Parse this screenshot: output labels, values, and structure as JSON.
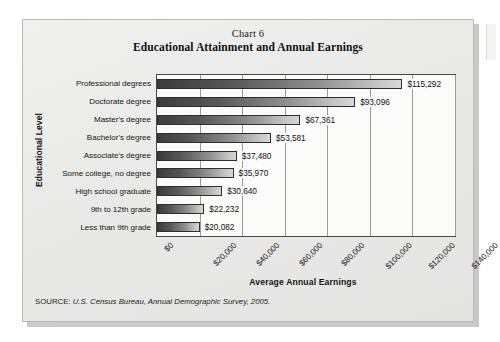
{
  "chart_data": {
    "type": "bar",
    "orientation": "horizontal",
    "chart_number": "Chart 6",
    "title": "Educational Attainment and Annual Earnings",
    "xlabel": "Average Annual Earnings",
    "ylabel": "Educational Level",
    "categories": [
      "Professional degrees",
      "Doctorate degree",
      "Master's degree",
      "Bachelor's degree",
      "Associate's degree",
      "Some college, no degree",
      "High school graduate",
      "9th to 12th grade",
      "Less than 9th grade"
    ],
    "values": [
      115292,
      93096,
      67361,
      53581,
      37480,
      35970,
      30640,
      22232,
      20082
    ],
    "value_labels": [
      "$115,292",
      "$93,096",
      "$67,361",
      "$53,581",
      "$37,480",
      "$35,970",
      "$30,640",
      "$22,232",
      "$20,082"
    ],
    "xlim": [
      0,
      140000
    ],
    "xtick_values": [
      0,
      20000,
      40000,
      60000,
      80000,
      100000,
      120000,
      140000
    ],
    "xtick_labels": [
      "$0",
      "$20,000",
      "$40,000",
      "$60,000",
      "$80,000",
      "$100,000",
      "$120,000",
      "$140,000"
    ],
    "grid": "vertical",
    "legend": "none",
    "bar_color_start": "#3c3c3c",
    "bar_color_end": "#d8d8d8",
    "plot_background": "#fbfbfa",
    "card_background": "#ececeb"
  },
  "source": {
    "label": "SOURCE:",
    "text": "U.S. Census Bureau, Annual Demographic Survey, 2005."
  }
}
